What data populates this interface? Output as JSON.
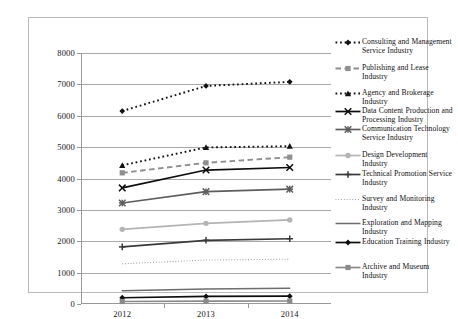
{
  "chart_data": {
    "type": "line",
    "title": "",
    "xlabel": "",
    "ylabel": "",
    "categories": [
      "2012",
      "2013",
      "2014"
    ],
    "x_tick_labels": [
      "2012",
      "2013",
      "2014"
    ],
    "y_tick_labels": [
      "0",
      "1000",
      "2000",
      "3000",
      "4000",
      "5000",
      "6000",
      "7000",
      "8000"
    ],
    "y_ticks": [
      0,
      1000,
      2000,
      3000,
      4000,
      5000,
      6000,
      7000,
      8000
    ],
    "ylim": [
      0,
      8000
    ],
    "grid": true,
    "legend_position": "right",
    "series": [
      {
        "name": "Consulting and Management Service Industry",
        "values": [
          6150,
          6950,
          7080
        ],
        "color": "#111111",
        "line_style": "dotted",
        "marker": "diamond"
      },
      {
        "name": "Publishing and Lease Industry",
        "values": [
          4180,
          4500,
          4680
        ],
        "color": "#8f8f8f",
        "line_style": "dashed",
        "marker": "square"
      },
      {
        "name": "Agency and Brokerage Industry",
        "values": [
          4420,
          4990,
          5030
        ],
        "color": "#111111",
        "line_style": "dotted",
        "marker": "triangle"
      },
      {
        "name": "Data Content Production and Processing Industry",
        "values": [
          3700,
          4270,
          4350
        ],
        "color": "#0d0d0d",
        "line_style": "solid",
        "marker": "x"
      },
      {
        "name": "Communication Technology Service Industry",
        "values": [
          3220,
          3580,
          3660
        ],
        "color": "#5e5e5e",
        "line_style": "solid",
        "marker": "asterisk"
      },
      {
        "name": "Design Development Industry",
        "values": [
          2380,
          2570,
          2680
        ],
        "color": "#b4b4b4",
        "line_style": "solid",
        "marker": "circle"
      },
      {
        "name": "Technical Promotion Service Industry",
        "values": [
          1820,
          2030,
          2080
        ],
        "color": "#3a3a3a",
        "line_style": "solid",
        "marker": "plus"
      },
      {
        "name": "Survey and Monitoring Industry",
        "values": [
          1280,
          1400,
          1430
        ],
        "color": "#9c9c9c",
        "line_style": "fine-dotted",
        "marker": "none"
      },
      {
        "name": "Exploration and Mapping Industry",
        "values": [
          420,
          480,
          500
        ],
        "color": "#6e6e6e",
        "line_style": "solid",
        "marker": "none"
      },
      {
        "name": "Education Training Industry",
        "values": [
          200,
          240,
          250
        ],
        "color": "#0d0d0d",
        "line_style": "solid",
        "marker": "diamond"
      },
      {
        "name": "Archive and Museum Industry",
        "values": [
          80,
          90,
          95
        ],
        "color": "#8a8a8a",
        "line_style": "solid",
        "marker": "square"
      }
    ]
  }
}
